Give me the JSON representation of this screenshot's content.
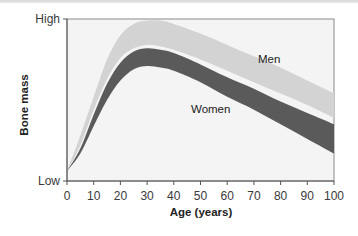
{
  "chart_data": {
    "type": "area",
    "title": "",
    "xlabel": "Age (years)",
    "ylabel": "Bone mass",
    "xlim": [
      0,
      100
    ],
    "ylim": [
      "Low",
      "High"
    ],
    "x_ticks": [
      0,
      10,
      20,
      30,
      40,
      50,
      60,
      70,
      80,
      90,
      100
    ],
    "y_ticks": [
      "Low",
      "High"
    ],
    "grid": false,
    "legend": "inline labels",
    "series": [
      {
        "name": "Men",
        "color": "#d3d3d3",
        "x": [
          0,
          5,
          10,
          15,
          20,
          25,
          30,
          35,
          40,
          50,
          60,
          70,
          80,
          90,
          100
        ],
        "upper": [
          6,
          28,
          52,
          75,
          90,
          97,
          99,
          99,
          97,
          91,
          84,
          77,
          70,
          62,
          54
        ],
        "lower": [
          6,
          22,
          44,
          63,
          76,
          82,
          84,
          83,
          81,
          75,
          68,
          61,
          54,
          47,
          39
        ]
      },
      {
        "name": "Women",
        "color": "#5a5a5a",
        "x": [
          0,
          5,
          10,
          15,
          20,
          25,
          30,
          35,
          40,
          50,
          60,
          70,
          80,
          90,
          100
        ],
        "upper": [
          6,
          20,
          41,
          60,
          73,
          80,
          82,
          81,
          79,
          72,
          64,
          57,
          49,
          42,
          35
        ],
        "lower": [
          6,
          17,
          34,
          50,
          62,
          69,
          71,
          70,
          68,
          61,
          52,
          44,
          35,
          26,
          17
        ]
      }
    ],
    "annotations": [
      {
        "text": "Men",
        "x": 72,
        "y": 75
      },
      {
        "text": "Women",
        "x": 47,
        "y": 44
      }
    ]
  },
  "labels": {
    "y_high": "High",
    "y_low": "Low",
    "y_title": "Bone mass",
    "x_title": "Age (years)",
    "men": "Men",
    "women": "Women",
    "x_ticks": [
      "0",
      "10",
      "20",
      "30",
      "40",
      "50",
      "60",
      "70",
      "80",
      "90",
      "100"
    ]
  },
  "colors": {
    "plot_bg": "#f4f4f4",
    "men_band": "#d3d3d3",
    "women_band": "#5a5a5a",
    "axis": "#555555"
  }
}
